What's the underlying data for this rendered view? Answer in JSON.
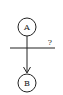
{
  "diagram": {
    "nodes": [
      {
        "id": "A",
        "label": "A"
      },
      {
        "id": "B",
        "label": "B"
      }
    ],
    "edges": [
      {
        "from": "A",
        "to": "B",
        "directed": true
      }
    ],
    "cut_line": {
      "label": "?"
    },
    "colors": {
      "stroke": "#222222",
      "background": "#ffffff"
    }
  }
}
